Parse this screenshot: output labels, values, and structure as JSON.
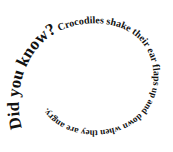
{
  "spiral": {
    "segments": [
      {
        "text": "Did you know?",
        "size": 17
      },
      {
        "text": " Crocodiles shake their ear flaps",
        "size": 10
      },
      {
        "text": " up and down when they are angry.",
        "size": 9
      }
    ],
    "full_text": "Did you know? Crocodiles shake their ear flaps up and down when they are angry.",
    "text_color": "#111111",
    "background": "#ffffff"
  }
}
